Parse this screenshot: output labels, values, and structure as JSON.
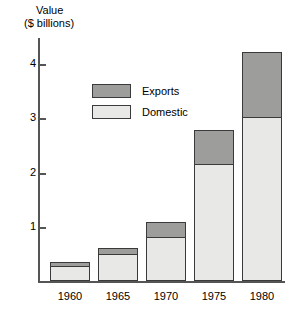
{
  "chart_data": {
    "type": "bar",
    "title": "",
    "ylabel_lines": [
      "Value",
      "($ billions)"
    ],
    "xlabel": "",
    "categories": [
      "1960",
      "1965",
      "1970",
      "1975",
      "1980"
    ],
    "series": [
      {
        "name": "Domestic",
        "color": "#e8e8e6",
        "values": [
          0.28,
          0.49,
          0.82,
          2.15,
          3.02
        ]
      },
      {
        "name": "Exports",
        "color": "#9d9d9b",
        "values": [
          0.08,
          0.13,
          0.28,
          0.65,
          1.23
        ]
      }
    ],
    "totals": [
      0.36,
      0.62,
      1.1,
      2.8,
      4.25
    ],
    "stacked": true,
    "ylim": [
      0,
      4.48
    ],
    "yticks": [
      "1",
      "2",
      "3",
      "4"
    ],
    "ytick_values": [
      1,
      2,
      3,
      4
    ],
    "grid": false,
    "legend_position": "upper-left",
    "legend_entries": [
      "Exports",
      "Domestic"
    ]
  },
  "axis": {
    "y_title_line1": "Value",
    "y_title_line2": "($ billions)"
  }
}
